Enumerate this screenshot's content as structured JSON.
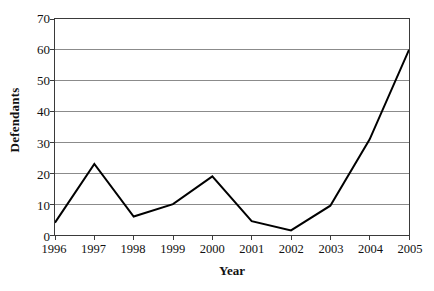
{
  "chart_data": {
    "type": "line",
    "title": "",
    "xlabel": "Year",
    "ylabel": "Defendants",
    "categories": [
      "1996",
      "1997",
      "1998",
      "1999",
      "2000",
      "2001",
      "2002",
      "2003",
      "2004",
      "2005"
    ],
    "values": [
      4,
      23,
      6,
      10,
      19,
      4.5,
      1.5,
      9.5,
      31,
      60
    ],
    "series": [
      {
        "name": "Defendants",
        "values": [
          4,
          23,
          6,
          10,
          19,
          4.5,
          1.5,
          9.5,
          31,
          60
        ]
      }
    ],
    "ylim": [
      0,
      70
    ],
    "ytick_labels": [
      "0",
      "10",
      "20",
      "30",
      "40",
      "50",
      "60",
      "70"
    ],
    "ytick_values": [
      0,
      10,
      20,
      30,
      40,
      50,
      60,
      70
    ],
    "grid": "horizontal",
    "legend": "none",
    "line_color": "#000000",
    "grid_color": "#8a8a8a",
    "axis_color": "#3a3a3a",
    "background_color": "#ffffff"
  }
}
